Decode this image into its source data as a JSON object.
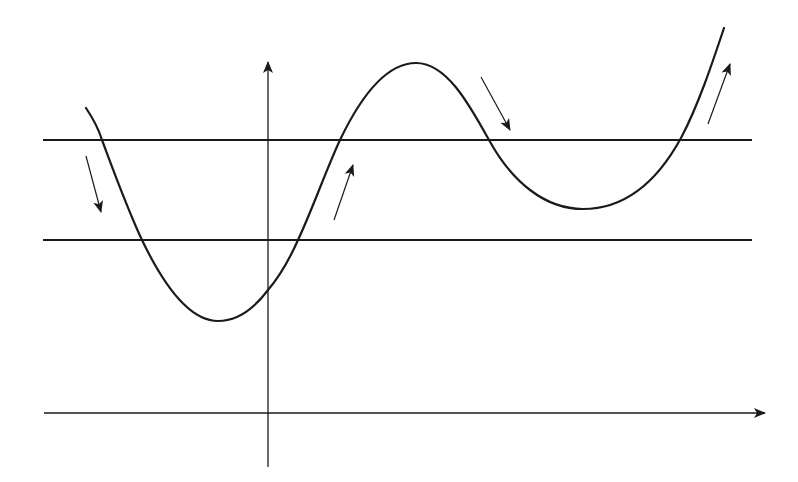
{
  "diagram": {
    "type": "function-curve-with-threshold-lines",
    "background": "#ffffff",
    "stroke_color": "#1a1a1a",
    "axes": {
      "y_axis": {
        "x": 268,
        "y_top": 62,
        "y_bottom": 467,
        "arrow": "up"
      },
      "x_axis": {
        "y": 413,
        "x_left": 44,
        "x_right": 765,
        "arrow": "right"
      }
    },
    "threshold_lines": [
      {
        "name": "upper-line",
        "y": 140,
        "x_left": 43,
        "x_right": 752
      },
      {
        "name": "lower-line",
        "y": 240,
        "x_left": 43,
        "x_right": 752
      }
    ],
    "curve": {
      "description": "oscillating curve: descends, local minimum below lower line, rises to maximum above upper line, descends to local minimum between lines, rises steeply",
      "key_points": [
        {
          "label": "start",
          "x": 86,
          "y": 108
        },
        {
          "label": "cross-upper-1",
          "x": 102,
          "y": 140
        },
        {
          "label": "cross-lower-1",
          "x": 142,
          "y": 240
        },
        {
          "label": "local-min-1",
          "x": 218,
          "y": 321
        },
        {
          "label": "cross-y-axis",
          "x": 268,
          "y": 290
        },
        {
          "label": "cross-lower-2",
          "x": 298,
          "y": 240
        },
        {
          "label": "cross-upper-2",
          "x": 340,
          "y": 140
        },
        {
          "label": "local-max",
          "x": 416,
          "y": 63
        },
        {
          "label": "cross-upper-3",
          "x": 489,
          "y": 140
        },
        {
          "label": "local-min-2",
          "x": 583,
          "y": 209
        },
        {
          "label": "cross-upper-4",
          "x": 681,
          "y": 138
        },
        {
          "label": "end",
          "x": 724,
          "y": 28
        }
      ]
    },
    "direction_arrows": [
      {
        "name": "arrow-down-left",
        "direction": "down",
        "x1": 86,
        "y1": 156,
        "x2": 101,
        "y2": 212
      },
      {
        "name": "arrow-up-center",
        "direction": "up",
        "x1": 334,
        "y1": 220,
        "x2": 353,
        "y2": 165
      },
      {
        "name": "arrow-down-right",
        "direction": "down",
        "x1": 481,
        "y1": 77,
        "x2": 510,
        "y2": 130
      },
      {
        "name": "arrow-up-far-right",
        "direction": "up",
        "x1": 708,
        "y1": 124,
        "x2": 730,
        "y2": 64
      }
    ]
  }
}
